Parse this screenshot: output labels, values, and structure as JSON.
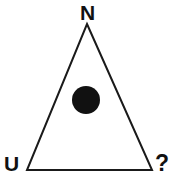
{
  "figure": {
    "type": "shape-diagram",
    "background_color": "#ffffff",
    "stroke_color": "#1a1a1a",
    "fill_color": "#111111",
    "labels": {
      "top": "N",
      "bottom_left": "U",
      "bottom_right": "?"
    },
    "shapes": {
      "triangle": {
        "name": "triangle-outline",
        "points": "87,24 152,170 27,170",
        "stroke_width": "2",
        "fill": "none"
      },
      "dot": {
        "name": "filled-circle",
        "cx": "86",
        "cy": "100",
        "r": "14"
      }
    }
  }
}
